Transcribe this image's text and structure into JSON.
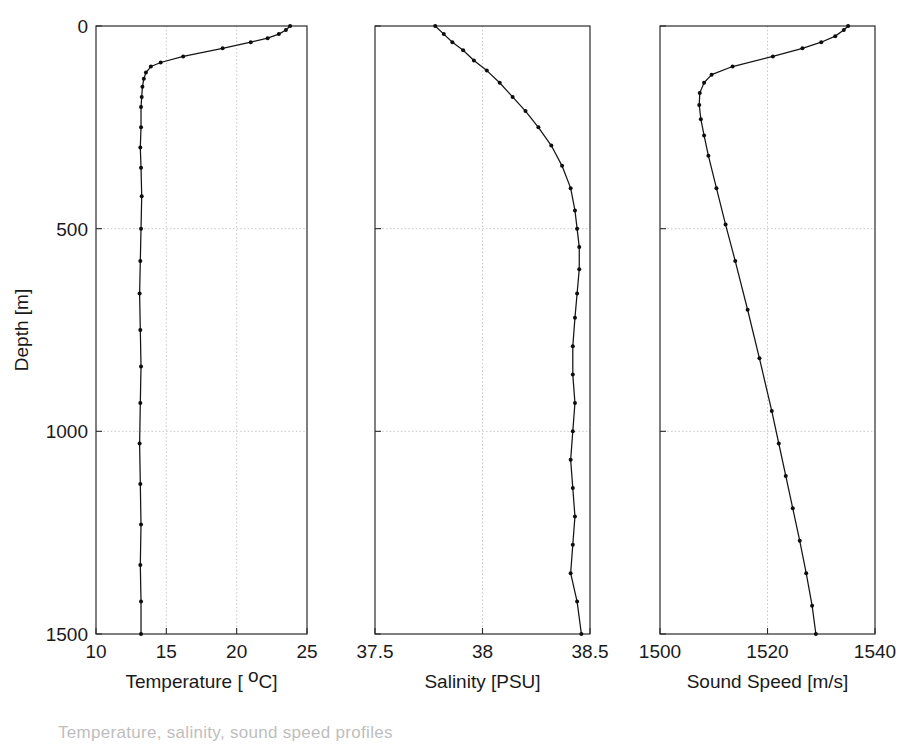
{
  "figure": {
    "background_color": "#ffffff",
    "line_color": "#141414",
    "marker_color": "#0d0d0d",
    "axis_color": "#2b2b2b",
    "grid_color": "#b9b9b9",
    "shared_ylabel": "Depth [m]",
    "y_ticks": [
      "0",
      "500",
      "1000",
      "1500"
    ],
    "partial_caption": "Temperature, salinity, sound speed profiles"
  },
  "chart_data": [
    {
      "type": "line",
      "title": "",
      "xlabel": "Temperature [ °C]",
      "ylabel": "Depth [m]",
      "xlim": [
        10,
        25
      ],
      "ylim": [
        0,
        1500
      ],
      "y_inverted": true,
      "grid": true,
      "legend": "none",
      "xticks": [
        10,
        15,
        20,
        25
      ],
      "xtick_labels": [
        "10",
        "15",
        "20",
        "25"
      ],
      "yticks": [
        0,
        500,
        1000,
        1500
      ],
      "ytick_labels": [
        "0",
        "500",
        "1000",
        "1500"
      ],
      "markers": "dot",
      "x": [
        23.8,
        23.5,
        23.0,
        22.2,
        21.0,
        19.0,
        16.2,
        14.6,
        13.9,
        13.55,
        13.4,
        13.3,
        13.25,
        13.2,
        13.2,
        13.15,
        13.2,
        13.25,
        13.2,
        13.15,
        13.1,
        13.15,
        13.2,
        13.15,
        13.1,
        13.15,
        13.2
      ],
      "y": [
        0,
        10,
        20,
        30,
        40,
        55,
        75,
        90,
        100,
        115,
        130,
        150,
        175,
        200,
        250,
        300,
        350,
        420,
        500,
        580,
        660,
        750,
        840,
        930,
        1030,
        1130,
        1230
      ],
      "x_tail": [
        13.15,
        13.2,
        13.2
      ],
      "y_tail": [
        1330,
        1420,
        1500
      ]
    },
    {
      "type": "line",
      "title": "",
      "xlabel": "Salinity [PSU]",
      "ylabel": "Depth [m]",
      "xlim": [
        37.5,
        38.5
      ],
      "ylim": [
        0,
        1500
      ],
      "y_inverted": true,
      "grid": true,
      "legend": "none",
      "xticks": [
        37.5,
        38,
        38.5
      ],
      "xtick_labels": [
        "37.5",
        "38",
        "38.5"
      ],
      "yticks": [
        0,
        500,
        1000,
        1500
      ],
      "ytick_labels": [
        "0",
        "500",
        "1000",
        "1500"
      ],
      "markers": "dot",
      "x": [
        37.78,
        37.82,
        37.86,
        37.91,
        37.96,
        38.02,
        38.08,
        38.14,
        38.2,
        38.26,
        38.32,
        38.37,
        38.41,
        38.43,
        38.44,
        38.45,
        38.45,
        38.44,
        38.43,
        38.42,
        38.42,
        38.43,
        38.42,
        38.41,
        38.42,
        38.43,
        38.42,
        38.41,
        38.44,
        38.46
      ],
      "y": [
        0,
        20,
        40,
        60,
        85,
        110,
        140,
        175,
        210,
        250,
        295,
        345,
        400,
        455,
        500,
        545,
        600,
        660,
        720,
        790,
        860,
        930,
        1000,
        1070,
        1140,
        1210,
        1280,
        1350,
        1420,
        1500
      ]
    },
    {
      "type": "line",
      "title": "",
      "xlabel": "Sound Speed [m/s]",
      "ylabel": "Depth [m]",
      "xlim": [
        1500,
        1540
      ],
      "ylim": [
        0,
        1500
      ],
      "y_inverted": true,
      "grid": true,
      "legend": "none",
      "xticks": [
        1500,
        1520,
        1540
      ],
      "xtick_labels": [
        "1500",
        "1520",
        "1540"
      ],
      "yticks": [
        0,
        500,
        1000,
        1500
      ],
      "ytick_labels": [
        "0",
        "500",
        "1000",
        "1500"
      ],
      "markers": "dot",
      "x": [
        1535.0,
        1534.2,
        1532.6,
        1530.0,
        1526.5,
        1521.0,
        1513.5,
        1509.6,
        1508.2,
        1507.4,
        1507.3,
        1507.6,
        1508.2,
        1509.0,
        1510.5,
        1512.2,
        1514.0,
        1516.3,
        1518.5,
        1520.8,
        1522.1,
        1523.4,
        1524.7,
        1526.0,
        1527.2,
        1528.3,
        1529.0
      ],
      "y": [
        0,
        10,
        25,
        40,
        55,
        75,
        100,
        120,
        140,
        165,
        195,
        230,
        270,
        320,
        400,
        490,
        580,
        700,
        820,
        950,
        1030,
        1110,
        1190,
        1270,
        1350,
        1430,
        1500
      ]
    }
  ]
}
